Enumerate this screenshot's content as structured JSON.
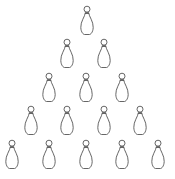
{
  "figure": {
    "rows": [
      1,
      2,
      3,
      4,
      5
    ],
    "total_pins": 15,
    "icon": "bowling-pin-icon",
    "stroke_color": "#555555",
    "background_color": "#ffffff"
  }
}
